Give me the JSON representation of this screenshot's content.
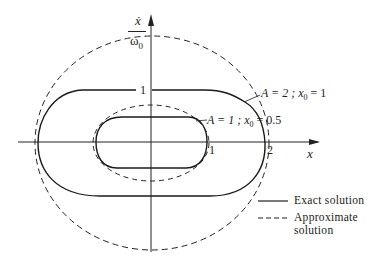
{
  "diagram": {
    "y_axis_label": {
      "numerator": "ẋ",
      "denominator": "ω",
      "denominator_sub": "0"
    },
    "x_axis_label": "x",
    "x_ticks": [
      "1",
      "2"
    ],
    "y_ticks": [
      "1"
    ],
    "curve_labels": [
      {
        "text_a": "A = 2 ; x",
        "sub": "0",
        "text_b": " = 1"
      },
      {
        "text_a": "A = 1 ; x",
        "sub": "0",
        "text_b": " = 0.5"
      }
    ],
    "legend": {
      "exact": "Exact solution",
      "approx_line1": "Approximate",
      "approx_line2": "solution"
    },
    "colors": {
      "ink": "#1a1a1a",
      "background": "#ffffff"
    }
  }
}
